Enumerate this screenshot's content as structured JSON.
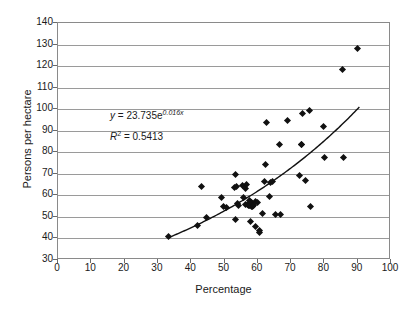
{
  "chart_data": {
    "type": "scatter",
    "title": "",
    "xlabel": "Percentage",
    "ylabel": "Persons per hectare",
    "xlim": [
      0,
      100
    ],
    "ylim": [
      30,
      140
    ],
    "xticks": [
      0,
      10,
      20,
      30,
      40,
      50,
      60,
      70,
      80,
      90,
      100
    ],
    "yticks": [
      30,
      40,
      50,
      60,
      70,
      80,
      90,
      100,
      110,
      120,
      130,
      140
    ],
    "grid": "horizontal",
    "legend": "none",
    "series": [
      {
        "name": "observations",
        "marker": "diamond",
        "color": "#111111",
        "points": [
          [
            33.2,
            40.7
          ],
          [
            41.9,
            45.8
          ],
          [
            43.1,
            64.3
          ],
          [
            44.6,
            49.6
          ],
          [
            49.2,
            59.2
          ],
          [
            49.8,
            54.6
          ],
          [
            50.6,
            54.2
          ],
          [
            52.9,
            63.5
          ],
          [
            53.2,
            69.6
          ],
          [
            53.4,
            48.6
          ],
          [
            53.6,
            64.1
          ],
          [
            54.0,
            56.2
          ],
          [
            54.2,
            55.1
          ],
          [
            55.3,
            64.6
          ],
          [
            55.6,
            58.8
          ],
          [
            56.2,
            55.6
          ],
          [
            56.4,
            63.0
          ],
          [
            56.7,
            64.9
          ],
          [
            56.9,
            55.8
          ],
          [
            57.2,
            55.2
          ],
          [
            57.4,
            57.8
          ],
          [
            57.6,
            55.4
          ],
          [
            57.8,
            47.9
          ],
          [
            58.0,
            55.0
          ],
          [
            58.2,
            56.8
          ],
          [
            58.4,
            54.9
          ],
          [
            58.6,
            55.3
          ],
          [
            59.2,
            45.6
          ],
          [
            59.4,
            57.1
          ],
          [
            59.8,
            56.9
          ],
          [
            60.4,
            43.6
          ],
          [
            60.6,
            42.7
          ],
          [
            61.4,
            51.8
          ],
          [
            62.0,
            66.4
          ],
          [
            62.3,
            74.2
          ],
          [
            62.6,
            93.9
          ],
          [
            63.6,
            59.7
          ],
          [
            63.9,
            66.2
          ],
          [
            64.3,
            66.5
          ],
          [
            65.4,
            51.0
          ],
          [
            66.6,
            83.4
          ],
          [
            66.8,
            50.9
          ],
          [
            68.8,
            94.6
          ],
          [
            72.6,
            69.1
          ],
          [
            73.0,
            83.6
          ],
          [
            73.2,
            83.5
          ],
          [
            73.3,
            98.1
          ],
          [
            74.2,
            66.9
          ],
          [
            75.6,
            99.5
          ],
          [
            75.8,
            54.9
          ],
          [
            79.8,
            92.1
          ],
          [
            80.1,
            77.7
          ],
          [
            85.3,
            118.4
          ],
          [
            85.6,
            77.6
          ],
          [
            89.9,
            128.0
          ]
        ]
      }
    ],
    "trendline": {
      "type": "exponential",
      "a": 23.735,
      "b": 0.016,
      "x_start": 33.2,
      "x_end": 90.5,
      "color": "#111111"
    },
    "annotations": {
      "equation_var": "y",
      "equation_body": " = 23.735e",
      "equation_exponent": "0.016x",
      "r2_var": "R",
      "r2_sup": "2",
      "r2_body": " = 0.5413"
    }
  }
}
